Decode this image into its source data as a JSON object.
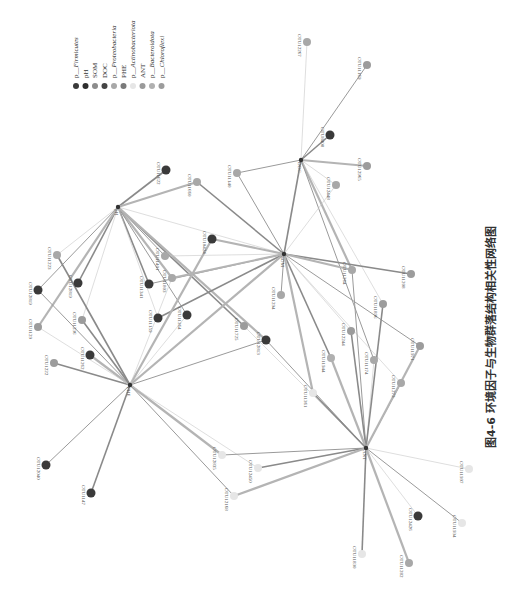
{
  "caption": "图4-6  环境因子与生物群落结构相关性网络图",
  "legend": {
    "orientation": "rotated-90",
    "items": [
      {
        "label": "p__Firmicutes",
        "color": "#3a3a3a",
        "italic_part": "Firmicutes"
      },
      {
        "label": "pH",
        "color": "#2e2e2e"
      },
      {
        "label": "SOM",
        "color": "#8c8c8c"
      },
      {
        "label": "DOC",
        "color": "#444444"
      },
      {
        "label": "p__Proteobacteria",
        "color": "#a8a8a8",
        "italic_part": "Proteobacteria"
      },
      {
        "label": "PHE",
        "color": "#7a7a7a"
      },
      {
        "label": "p__Actinobacteriota",
        "color": "#e6e6e6",
        "italic_part": "Actinobacteriota"
      },
      {
        "label": "ANT",
        "color": "#9a9a9a"
      },
      {
        "label": "p__Bacteroidota",
        "color": "#b0b0b0",
        "italic_part": "Bacteroidota"
      },
      {
        "label": "p__Chloroflexi",
        "color": "#9c9c9c",
        "italic_part": "Chloroflexi"
      }
    ]
  },
  "chart_data": {
    "type": "network",
    "title": "环境因子与生物群落结构相关性网络图",
    "hubs": [
      {
        "id": "pH",
        "x": 118,
        "y": 207
      },
      {
        "id": "SOM",
        "x": 284,
        "y": 254
      },
      {
        "id": "DOC",
        "x": 301,
        "y": 160
      },
      {
        "id": "PHE",
        "x": 130,
        "y": 385
      },
      {
        "id": "ANT",
        "x": 366,
        "y": 448
      }
    ],
    "nodes": [
      {
        "id": "OTU12267",
        "x": 307,
        "y": 42,
        "group": "p__Proteobacteria"
      },
      {
        "id": "OTU11169",
        "x": 367,
        "y": 65,
        "group": "p__Chloroflexi"
      },
      {
        "id": "OTU8408",
        "x": 330,
        "y": 135,
        "group": "p__Firmicutes"
      },
      {
        "id": "OTU12965",
        "x": 367,
        "y": 166,
        "group": "p__Chloroflexi"
      },
      {
        "id": "OTU12448",
        "x": 336,
        "y": 185,
        "group": "p__Proteobacteria"
      },
      {
        "id": "OTU11622",
        "x": 166,
        "y": 170,
        "group": "p__Firmicutes"
      },
      {
        "id": "OTU11660",
        "x": 197,
        "y": 182,
        "group": "p__Proteobacteria"
      },
      {
        "id": "OTU11140",
        "x": 237,
        "y": 173,
        "group": "p__Proteobacteria"
      },
      {
        "id": "OTU11223",
        "x": 57,
        "y": 255,
        "group": "p__Proteobacteria"
      },
      {
        "id": "OTU12819",
        "x": 38,
        "y": 290,
        "group": "p__Firmicutes"
      },
      {
        "id": "OTU12819b",
        "x": 78,
        "y": 283,
        "group": "p__Firmicutes"
      },
      {
        "id": "OTU1129",
        "x": 38,
        "y": 327,
        "group": "p__Chloroflexi"
      },
      {
        "id": "OTU11236",
        "x": 82,
        "y": 320,
        "group": "p__Chloroflexi"
      },
      {
        "id": "OTU1222",
        "x": 54,
        "y": 363,
        "group": "p__Chloroflexi"
      },
      {
        "id": "OTU11262",
        "x": 90,
        "y": 355,
        "group": "p__Firmicutes"
      },
      {
        "id": "OTU12040",
        "x": 46,
        "y": 465,
        "group": "p__Firmicutes"
      },
      {
        "id": "OTU1147",
        "x": 91,
        "y": 493,
        "group": "p__Firmicutes"
      },
      {
        "id": "OTU11401",
        "x": 165,
        "y": 256,
        "group": "p__Proteobacteria"
      },
      {
        "id": "OTU10424",
        "x": 212,
        "y": 239,
        "group": "p__Firmicutes"
      },
      {
        "id": "OTU11341",
        "x": 149,
        "y": 284,
        "group": "p__Firmicutes"
      },
      {
        "id": "OTU11803",
        "x": 172,
        "y": 278,
        "group": "p__Proteobacteria"
      },
      {
        "id": "OTU11159",
        "x": 158,
        "y": 318,
        "group": "p__Firmicutes"
      },
      {
        "id": "OTU11364",
        "x": 187,
        "y": 315,
        "group": "p__Firmicutes"
      },
      {
        "id": "OTU11725",
        "x": 244,
        "y": 326,
        "group": "p__Chloroflexi"
      },
      {
        "id": "OTU12813",
        "x": 266,
        "y": 340,
        "group": "p__Firmicutes"
      },
      {
        "id": "OTU11294",
        "x": 281,
        "y": 295,
        "group": "p__Proteobacteria"
      },
      {
        "id": "OTU11208",
        "x": 411,
        "y": 274,
        "group": "p__Chloroflexi"
      },
      {
        "id": "OTU11264",
        "x": 352,
        "y": 270,
        "group": "p__Proteobacteria"
      },
      {
        "id": "OTU11896",
        "x": 383,
        "y": 304,
        "group": "p__Chloroflexi"
      },
      {
        "id": "OTU12244",
        "x": 351,
        "y": 331,
        "group": "p__Chloroflexi"
      },
      {
        "id": "OTU11971",
        "x": 420,
        "y": 346,
        "group": "p__Chloroflexi"
      },
      {
        "id": "OTU11944",
        "x": 331,
        "y": 358,
        "group": "p__Bacteroidota"
      },
      {
        "id": "OTU11174",
        "x": 374,
        "y": 360,
        "group": "p__Proteobacteria"
      },
      {
        "id": "OTU11273",
        "x": 401,
        "y": 383,
        "group": "p__Proteobacteria"
      },
      {
        "id": "OTU11361",
        "x": 313,
        "y": 393,
        "group": "p__Actinobacteriota"
      },
      {
        "id": "OTU11997",
        "x": 469,
        "y": 469,
        "group": "p__Actinobacteriota"
      },
      {
        "id": "OTU12835",
        "x": 222,
        "y": 455,
        "group": "p__Actinobacteriota"
      },
      {
        "id": "OTU12450",
        "x": 258,
        "y": 468,
        "group": "p__Actinobacteriota"
      },
      {
        "id": "OTU12168",
        "x": 234,
        "y": 496,
        "group": "p__Actinobacteriota"
      },
      {
        "id": "OTU12426",
        "x": 418,
        "y": 516,
        "group": "p__Firmicutes"
      },
      {
        "id": "OTU11934",
        "x": 462,
        "y": 523,
        "group": "p__Actinobacteriota"
      },
      {
        "id": "OTU11830",
        "x": 362,
        "y": 554,
        "group": "p__Actinobacteriota"
      },
      {
        "id": "OTU11282",
        "x": 409,
        "y": 563,
        "group": "p__Proteobacteria"
      }
    ],
    "edges": [
      [
        "DOC",
        "OTU12267"
      ],
      [
        "DOC",
        "OTU11169"
      ],
      [
        "DOC",
        "OTU8408"
      ],
      [
        "DOC",
        "OTU12965"
      ],
      [
        "DOC",
        "OTU12448"
      ],
      [
        "DOC",
        "OTU11140"
      ],
      [
        "DOC",
        "SOM"
      ],
      [
        "DOC",
        "OTU11264"
      ],
      [
        "DOC",
        "OTU11896"
      ],
      [
        "DOC",
        "OTU11174"
      ],
      [
        "pH",
        "OTU11622"
      ],
      [
        "pH",
        "OTU11660"
      ],
      [
        "pH",
        "OTU11223"
      ],
      [
        "pH",
        "OTU12819"
      ],
      [
        "pH",
        "OTU12819b"
      ],
      [
        "pH",
        "OTU1129"
      ],
      [
        "pH",
        "OTU11236"
      ],
      [
        "pH",
        "OTU11401"
      ],
      [
        "pH",
        "OTU11341"
      ],
      [
        "pH",
        "OTU11803"
      ],
      [
        "pH",
        "OTU11159"
      ],
      [
        "pH",
        "OTU11364"
      ],
      [
        "pH",
        "OTU11725"
      ],
      [
        "pH",
        "OTU12813"
      ],
      [
        "pH",
        "SOM"
      ],
      [
        "SOM",
        "OTU11140"
      ],
      [
        "SOM",
        "OTU11660"
      ],
      [
        "SOM",
        "OTU10424"
      ],
      [
        "SOM",
        "OTU11401"
      ],
      [
        "SOM",
        "OTU11294"
      ],
      [
        "SOM",
        "OTU11208"
      ],
      [
        "SOM",
        "OTU11264"
      ],
      [
        "SOM",
        "OTU12244"
      ],
      [
        "SOM",
        "OTU11971"
      ],
      [
        "SOM",
        "OTU11944"
      ],
      [
        "SOM",
        "OTU11361"
      ],
      [
        "SOM",
        "OTU11273"
      ],
      [
        "SOM",
        "OTU11341"
      ],
      [
        "SOM",
        "OTU11159"
      ],
      [
        "SOM",
        "OTU11803"
      ],
      [
        "SOM",
        "OTU12448"
      ],
      [
        "PHE",
        "OTU12819"
      ],
      [
        "PHE",
        "OTU1222"
      ],
      [
        "PHE",
        "OTU11262"
      ],
      [
        "PHE",
        "OTU1129"
      ],
      [
        "PHE",
        "OTU12040"
      ],
      [
        "PHE",
        "OTU1147"
      ],
      [
        "PHE",
        "OTU10424"
      ],
      [
        "PHE",
        "OTU11364"
      ],
      [
        "PHE",
        "OTU12813"
      ],
      [
        "PHE",
        "OTU11236"
      ],
      [
        "PHE",
        "OTU12835"
      ],
      [
        "PHE",
        "OTU12450"
      ],
      [
        "PHE",
        "OTU12168"
      ],
      [
        "PHE",
        "OTU11223"
      ],
      [
        "PHE",
        "SOM"
      ],
      [
        "PHE",
        "OTU11803"
      ],
      [
        "ANT",
        "OTU11264"
      ],
      [
        "ANT",
        "OTU12244"
      ],
      [
        "ANT",
        "OTU11944"
      ],
      [
        "ANT",
        "OTU11174"
      ],
      [
        "ANT",
        "OTU11273"
      ],
      [
        "ANT",
        "OTU11896"
      ],
      [
        "ANT",
        "OTU11971"
      ],
      [
        "ANT",
        "OTU11997"
      ],
      [
        "ANT",
        "OTU12835"
      ],
      [
        "ANT",
        "OTU12450"
      ],
      [
        "ANT",
        "OTU12168"
      ],
      [
        "ANT",
        "OTU12426"
      ],
      [
        "ANT",
        "OTU11934"
      ],
      [
        "ANT",
        "OTU11830"
      ],
      [
        "ANT",
        "OTU11282"
      ],
      [
        "ANT",
        "OTU11725"
      ],
      [
        "ANT",
        "OTU12813"
      ],
      [
        "ANT",
        "OTU11361"
      ]
    ]
  }
}
